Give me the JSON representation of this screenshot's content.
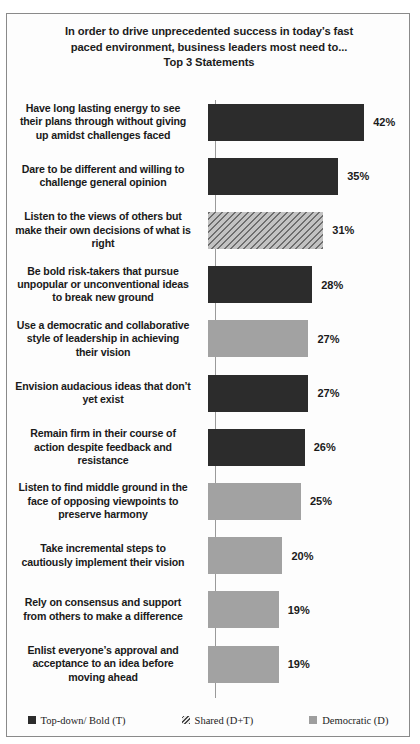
{
  "chart_data": {
    "type": "bar",
    "orientation": "horizontal",
    "title": "In order to drive unprecedented success in today’s fast paced environment, business leaders most need to... Top 3 Statements",
    "title_lines": [
      "In order to drive unprecedented success in today’s fast",
      "paced environment, business leaders most need to...",
      "Top 3 Statements"
    ],
    "xlabel": "",
    "ylabel": "",
    "xlim": [
      0,
      45
    ],
    "grid": false,
    "legend_position": "bottom",
    "value_suffix": "%",
    "categories": [
      "Have long lasting energy to see\ntheir plans through without giving\nup amidst challenges faced",
      "Dare to be different and willing to\nchallenge  general opinion",
      "Listen to the views of others but\nmake their own decisions of what is\nright",
      "Be bold risk-takers  that pursue\nunpopular or unconventional ideas\nto break new ground",
      "Use a democratic and collaborative\nstyle of leadership  in achieving\ntheir vision",
      "Envision audacious ideas that don’t\nyet exist",
      "Remain firm in their course of\naction despite feedback and\nresistance",
      "Listen to find middle ground in the\nface of opposing viewpoints  to\npreserve harmony",
      "Take incremental steps to\ncautiously implement their vision",
      "Rely on consensus and support\nfrom others to make a difference",
      "Enlist everyone’s approval and\nacceptance to an idea before\nmoving ahead"
    ],
    "values": [
      42,
      35,
      31,
      28,
      27,
      27,
      26,
      25,
      20,
      19,
      19
    ],
    "value_labels": [
      "42%",
      "35%",
      "31%",
      "28%",
      "27%",
      "27%",
      "26%",
      "25%",
      "20%",
      "19%",
      "19%"
    ],
    "series_assignment": [
      "topdown",
      "topdown",
      "shared",
      "topdown",
      "democratic",
      "topdown",
      "topdown",
      "democratic",
      "democratic",
      "democratic",
      "democratic"
    ],
    "legend": [
      {
        "key": "topdown",
        "label": "Top-down/ Bold (T)",
        "color": "#2c2c2c"
      },
      {
        "key": "shared",
        "label": "Shared (D+T)",
        "color": "#a8a8a8"
      },
      {
        "key": "democratic",
        "label": "Democratic (D)",
        "color": "#a2a2a2"
      }
    ]
  }
}
